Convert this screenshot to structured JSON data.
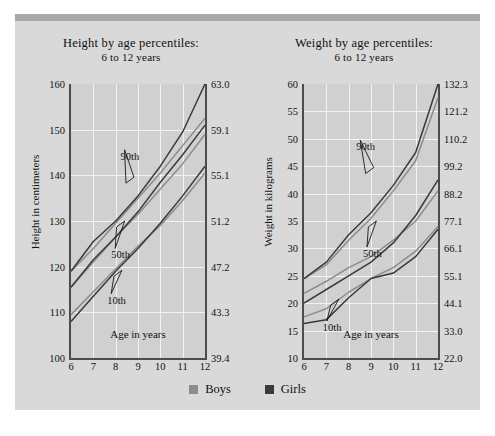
{
  "figure": {
    "background_color": "#d9d9d9",
    "top_strip_color": "#a8a8a8",
    "plot_background": "#d0d0d0",
    "grid_color": "#f2f2f2"
  },
  "legend": {
    "items": [
      {
        "label": "Boys",
        "color": "#8c8c8c"
      },
      {
        "label": "Girls",
        "color": "#3a3a3a"
      }
    ]
  },
  "chart_data": [
    {
      "type": "line",
      "id": "height-by-age",
      "title": "Height by age percentiles:",
      "subtitle": "6 to 12 years",
      "xlabel": "Age in years",
      "ylabel": "Height in centimeters",
      "ylabel_right": "Height in inches",
      "x": [
        6,
        7,
        8,
        9,
        10,
        11,
        12
      ],
      "xlim": [
        6,
        12
      ],
      "xticks": [
        "6",
        "7",
        "8",
        "9",
        "10",
        "11",
        "12"
      ],
      "ylim": [
        100,
        160
      ],
      "yticks": [
        "100",
        "110",
        "120",
        "130",
        "140",
        "150",
        "160"
      ],
      "yticks_right": [
        "39.4",
        "43.3",
        "47.2",
        "51.2",
        "55.1",
        "59.1",
        "63.0"
      ],
      "grid": true,
      "annotations": [
        "90th",
        "50th",
        "10th"
      ],
      "series": [
        {
          "name": "Boys 90th",
          "percentile": "90th",
          "group": "Boys",
          "color": "#8c8c8c",
          "values": [
            119.0,
            124.0,
            129.5,
            135.0,
            140.5,
            146.5,
            152.5
          ]
        },
        {
          "name": "Girls 90th",
          "percentile": "90th",
          "group": "Girls",
          "color": "#3a3a3a",
          "values": [
            119.0,
            125.5,
            130.0,
            135.5,
            142.0,
            149.5,
            160.0
          ]
        },
        {
          "name": "Boys 50th",
          "percentile": "50th",
          "group": "Boys",
          "color": "#8c8c8c",
          "values": [
            115.5,
            121.0,
            126.5,
            131.5,
            137.0,
            142.5,
            149.0
          ]
        },
        {
          "name": "Girls 50th",
          "percentile": "50th",
          "group": "Girls",
          "color": "#3a3a3a",
          "values": [
            115.5,
            121.5,
            126.5,
            132.0,
            138.5,
            144.5,
            151.0
          ]
        },
        {
          "name": "Boys 10th",
          "percentile": "10th",
          "group": "Boys",
          "color": "#8c8c8c",
          "values": [
            109.5,
            114.5,
            119.5,
            124.5,
            129.0,
            134.5,
            140.5
          ]
        },
        {
          "name": "Girls 10th",
          "percentile": "10th",
          "group": "Girls",
          "color": "#3a3a3a",
          "values": [
            108.0,
            113.5,
            119.0,
            124.0,
            129.5,
            135.5,
            142.0
          ]
        }
      ]
    },
    {
      "type": "line",
      "id": "weight-by-age",
      "title": "Weight by age percentiles:",
      "subtitle": "6 to 12 years",
      "xlabel": "Age in years",
      "ylabel": "Weight in kilograms",
      "ylabel_right": "Weight in pounds",
      "x": [
        6,
        7,
        8,
        9,
        10,
        11,
        12
      ],
      "xlim": [
        6,
        12
      ],
      "xticks": [
        "6",
        "7",
        "8",
        "9",
        "10",
        "11",
        "12"
      ],
      "ylim": [
        10,
        60
      ],
      "yticks": [
        "10",
        "15",
        "20",
        "25",
        "30",
        "35",
        "40",
        "45",
        "50",
        "55",
        "60"
      ],
      "yticks_right": [
        "22.0",
        "33.0",
        "44.1",
        "55.1",
        "66.1",
        "77.1",
        "88.2",
        "99.2",
        "110.2",
        "121.2",
        "132.3"
      ],
      "grid": true,
      "annotations": [
        "90th",
        "50th",
        "10th"
      ],
      "series": [
        {
          "name": "Boys 90th",
          "percentile": "90th",
          "group": "Boys",
          "color": "#8c8c8c",
          "values": [
            24.5,
            27.0,
            31.5,
            35.5,
            40.5,
            46.0,
            57.5
          ]
        },
        {
          "name": "Girls 90th",
          "percentile": "90th",
          "group": "Girls",
          "color": "#3a3a3a",
          "values": [
            24.5,
            27.5,
            32.5,
            36.5,
            41.5,
            47.5,
            60.0
          ]
        },
        {
          "name": "Boys 50th",
          "percentile": "50th",
          "group": "Boys",
          "color": "#8c8c8c",
          "values": [
            21.8,
            24.0,
            26.5,
            28.5,
            31.5,
            35.0,
            40.5
          ]
        },
        {
          "name": "Girls 50th",
          "percentile": "50th",
          "group": "Girls",
          "color": "#3a3a3a",
          "values": [
            20.0,
            22.5,
            25.0,
            27.5,
            31.0,
            36.0,
            42.5
          ]
        },
        {
          "name": "Boys 10th",
          "percentile": "10th",
          "group": "Boys",
          "color": "#8c8c8c",
          "values": [
            17.5,
            19.0,
            22.0,
            24.5,
            26.5,
            29.5,
            34.0
          ]
        },
        {
          "name": "Girls 10th",
          "percentile": "10th",
          "group": "Girls",
          "color": "#3a3a3a",
          "values": [
            16.3,
            17.0,
            21.0,
            24.5,
            25.5,
            28.5,
            33.5
          ]
        }
      ]
    }
  ]
}
